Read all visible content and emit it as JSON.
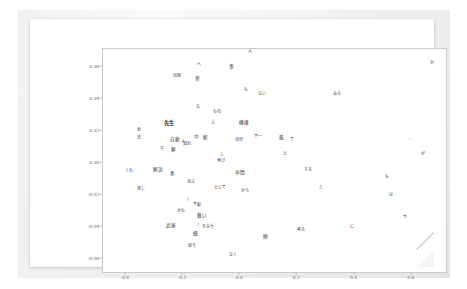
{
  "window": {
    "background_color": "#ffffff",
    "mat_color": "#ececec",
    "page_color": "#ffffff"
  },
  "chart_data": {
    "type": "scatter",
    "title": "",
    "subtitle": "",
    "xlabel": "",
    "ylabel": "",
    "xlim": [
      -0.48,
      0.72
    ],
    "ylim": [
      -0.068,
      0.071
    ],
    "xticks": [
      "-0.4",
      "-0.2",
      "0.0",
      "0.2",
      "0.4",
      "0.6"
    ],
    "xtick_values": [
      -0.4,
      -0.2,
      0.0,
      0.2,
      0.4,
      0.6
    ],
    "yticks": [
      "0.06",
      "0.04",
      "0.02",
      "0.00",
      "-0.02",
      "-0.04",
      "-0.06"
    ],
    "ytick_values": [
      0.06,
      0.04,
      0.02,
      0.0,
      -0.02,
      -0.04,
      -0.06
    ],
    "grid": false,
    "legend": null,
    "marker": "text",
    "points": [
      {
        "label": "文",
        "x": 0.035,
        "y": 0.0695,
        "size": "normal"
      },
      {
        "label": "か",
        "x": 0.672,
        "y": 0.0625,
        "size": "normal"
      },
      {
        "label": "へ",
        "x": -0.145,
        "y": 0.061,
        "size": "normal"
      },
      {
        "label": "事",
        "x": -0.03,
        "y": 0.06,
        "size": "mid"
      },
      {
        "label": "出席",
        "x": -0.222,
        "y": 0.054,
        "size": "normal"
      },
      {
        "label": "寄",
        "x": -0.148,
        "y": 0.0525,
        "size": "mid"
      },
      {
        "label": "も",
        "x": 0.022,
        "y": 0.0455,
        "size": "normal"
      },
      {
        "label": "ない",
        "x": 0.078,
        "y": 0.0428,
        "size": "normal"
      },
      {
        "label": "ある",
        "x": 0.34,
        "y": 0.0432,
        "size": "normal"
      },
      {
        "label": "な",
        "x": -0.148,
        "y": 0.035,
        "size": "normal"
      },
      {
        "label": "もの",
        "x": -0.082,
        "y": 0.032,
        "size": "normal"
      },
      {
        "label": "先生",
        "x": -0.248,
        "y": 0.0245,
        "size": "big"
      },
      {
        "label": "上",
        "x": -0.095,
        "y": 0.025,
        "size": "normal"
      },
      {
        "label": "機嫌",
        "x": 0.012,
        "y": 0.0248,
        "size": "mid"
      },
      {
        "label": "め",
        "x": -0.353,
        "y": 0.0205,
        "size": "normal"
      },
      {
        "label": "で一",
        "x": 0.062,
        "y": 0.016,
        "size": "normal"
      },
      {
        "label": "自分",
        "x": -0.003,
        "y": 0.014,
        "size": "normal"
      },
      {
        "label": "て",
        "x": 0.182,
        "y": 0.014,
        "size": "normal"
      },
      {
        "label": "風",
        "x": 0.143,
        "y": 0.0155,
        "size": "mid"
      },
      {
        "label": "氏",
        "x": -0.355,
        "y": 0.0158,
        "size": "normal"
      },
      {
        "label": "自動",
        "x": -0.228,
        "y": 0.0145,
        "size": "mid"
      },
      {
        "label": "中",
        "x": -0.152,
        "y": 0.016,
        "size": "mid"
      },
      {
        "label": "駅",
        "x": -0.122,
        "y": 0.0155,
        "size": "mid"
      },
      {
        "label": "人",
        "x": -0.2,
        "y": 0.0128,
        "size": "normal"
      },
      {
        "label": "知れ",
        "x": -0.186,
        "y": 0.0118,
        "size": "normal"
      },
      {
        "label": "、",
        "x": 0.598,
        "y": 0.0152,
        "size": "normal"
      },
      {
        "label": "牛",
        "x": -0.272,
        "y": 0.0085,
        "size": "normal"
      },
      {
        "label": "解",
        "x": -0.232,
        "y": 0.008,
        "size": "mid"
      },
      {
        "label": "が",
        "x": 0.638,
        "y": 0.0055,
        "size": "normal"
      },
      {
        "label": "し",
        "x": -0.062,
        "y": 0.0048,
        "size": "normal"
      },
      {
        "label": "再び",
        "x": -0.068,
        "y": 0.001,
        "size": "normal"
      },
      {
        "label": "くれ",
        "x": -0.388,
        "y": -0.0048,
        "size": "normal"
      },
      {
        "label": "解説",
        "x": -0.288,
        "y": -0.0042,
        "size": "mid"
      },
      {
        "label": "素",
        "x": -0.238,
        "y": -0.0068,
        "size": "mid"
      },
      {
        "label": "申間",
        "x": -0.002,
        "y": -0.006,
        "size": "mid"
      },
      {
        "label": "と",
        "x": 0.155,
        "y": 0.0058,
        "size": "normal"
      },
      {
        "label": "する",
        "x": 0.238,
        "y": -0.0045,
        "size": "normal"
      },
      {
        "label": "も",
        "x": 0.512,
        "y": -0.009,
        "size": "normal"
      },
      {
        "label": "消え",
        "x": -0.172,
        "y": -0.0118,
        "size": "normal"
      },
      {
        "label": "として",
        "x": -0.072,
        "y": -0.0155,
        "size": "normal"
      },
      {
        "label": "から",
        "x": 0.018,
        "y": -0.0175,
        "size": "normal"
      },
      {
        "label": "た",
        "x": 0.282,
        "y": -0.0155,
        "size": "normal"
      },
      {
        "label": "思し",
        "x": -0.348,
        "y": -0.0165,
        "size": "normal"
      },
      {
        "label": "は",
        "x": 0.528,
        "y": -0.0198,
        "size": "normal"
      },
      {
        "label": "「",
        "x": -0.186,
        "y": -0.0238,
        "size": "normal"
      },
      {
        "label": "で庭",
        "x": -0.152,
        "y": -0.0265,
        "size": "normal"
      },
      {
        "label": "かも",
        "x": -0.208,
        "y": -0.03,
        "size": "normal"
      },
      {
        "label": "難い",
        "x": -0.132,
        "y": -0.033,
        "size": "mid"
      },
      {
        "label": "で",
        "x": 0.578,
        "y": -0.0345,
        "size": "normal"
      },
      {
        "label": "武庫",
        "x": -0.242,
        "y": -0.0395,
        "size": "mid"
      },
      {
        "label": "」",
        "x": -0.145,
        "y": -0.0378,
        "size": "normal"
      },
      {
        "label": "を言う",
        "x": -0.112,
        "y": -0.04,
        "size": "normal"
      },
      {
        "label": "に",
        "x": 0.392,
        "y": -0.0398,
        "size": "normal"
      },
      {
        "label": "考る",
        "x": 0.212,
        "y": -0.0418,
        "size": "normal"
      },
      {
        "label": "細",
        "x": -0.158,
        "y": -0.044,
        "size": "mid"
      },
      {
        "label": "顔",
        "x": 0.09,
        "y": -0.046,
        "size": "mid"
      },
      {
        "label": "思う",
        "x": -0.17,
        "y": -0.0515,
        "size": "normal"
      },
      {
        "label": "なく",
        "x": -0.025,
        "y": -0.0575,
        "size": "normal"
      }
    ]
  }
}
